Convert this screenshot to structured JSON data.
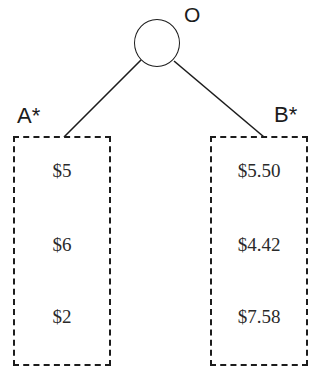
{
  "diagram": {
    "type": "game-tree-information-sets",
    "root": {
      "shape": "circle",
      "label": "O"
    },
    "edges": [
      {
        "from": "O",
        "to": "A*"
      },
      {
        "from": "O",
        "to": "B*"
      }
    ],
    "sets": [
      {
        "label": "A*",
        "style": "dashed-box",
        "payoffs": [
          "$5",
          "$6",
          "$2"
        ]
      },
      {
        "label": "B*",
        "style": "dashed-box",
        "payoffs": [
          "$5.50",
          "$4.42",
          "$7.58"
        ]
      }
    ],
    "colors": {
      "stroke": "#1c1c1c",
      "text": "#2a2a2a",
      "background": "#ffffff"
    }
  }
}
